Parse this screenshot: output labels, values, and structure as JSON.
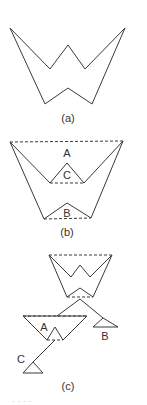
{
  "figure": {
    "panels": [
      {
        "id": "a",
        "caption": "(a)"
      },
      {
        "id": "b",
        "caption": "(b)",
        "labels": {
          "A": "A",
          "C": "C",
          "B": "B"
        }
      },
      {
        "id": "c",
        "caption": "(c)",
        "labels": {
          "A": "A",
          "B": "B",
          "C": "C"
        }
      }
    ],
    "footer_fragment": "· · · ·"
  }
}
